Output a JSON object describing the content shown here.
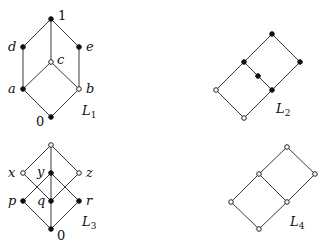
{
  "diagrams": [
    {
      "id": "L1",
      "label": "L",
      "subscript": "1",
      "nodes": [
        {
          "name": "1",
          "x": 51,
          "y": 19,
          "filled": true,
          "label": "1"
        },
        {
          "name": "d",
          "x": 23,
          "y": 47,
          "filled": true,
          "label": "d"
        },
        {
          "name": "e",
          "x": 79,
          "y": 47,
          "filled": true,
          "label": "e"
        },
        {
          "name": "c",
          "x": 51,
          "y": 62,
          "filled": false,
          "label": "c"
        },
        {
          "name": "a",
          "x": 23,
          "y": 89,
          "filled": true,
          "label": "a"
        },
        {
          "name": "b",
          "x": 79,
          "y": 89,
          "filled": false,
          "label": "b"
        },
        {
          "name": "0",
          "x": 51,
          "y": 117,
          "filled": true,
          "label": "0"
        }
      ],
      "edges": [
        [
          "1",
          "d"
        ],
        [
          "1",
          "e"
        ],
        [
          "1",
          "c"
        ],
        [
          "d",
          "a"
        ],
        [
          "e",
          "b"
        ],
        [
          "c",
          "a"
        ],
        [
          "c",
          "b"
        ],
        [
          "a",
          "0"
        ],
        [
          "b",
          "0"
        ]
      ]
    },
    {
      "id": "L2",
      "label": "L",
      "subscript": "2",
      "nodes": [
        {
          "name": "t",
          "x": 272,
          "y": 34,
          "filled": true
        },
        {
          "name": "r",
          "x": 300,
          "y": 62,
          "filled": true
        },
        {
          "name": "ul",
          "x": 244,
          "y": 62,
          "filled": true
        },
        {
          "name": "m",
          "x": 258,
          "y": 76,
          "filled": true
        },
        {
          "name": "mr",
          "x": 272,
          "y": 90,
          "filled": true
        },
        {
          "name": "l",
          "x": 216,
          "y": 90,
          "filled": false
        },
        {
          "name": "b",
          "x": 244,
          "y": 118,
          "filled": false
        }
      ],
      "edges": [
        [
          "t",
          "r"
        ],
        [
          "t",
          "ul"
        ],
        [
          "ul",
          "m"
        ],
        [
          "m",
          "mr"
        ],
        [
          "r",
          "mr"
        ],
        [
          "ul",
          "l"
        ],
        [
          "l",
          "b"
        ],
        [
          "mr",
          "b"
        ]
      ]
    },
    {
      "id": "L3",
      "label": "L",
      "subscript": "3",
      "nodes": [
        {
          "name": "top",
          "x": 51,
          "y": 145,
          "filled": false
        },
        {
          "name": "x",
          "x": 23,
          "y": 173,
          "filled": false,
          "label": "x"
        },
        {
          "name": "y",
          "x": 51,
          "y": 173,
          "filled": true,
          "label": "y"
        },
        {
          "name": "z",
          "x": 79,
          "y": 173,
          "filled": false,
          "label": "z"
        },
        {
          "name": "p",
          "x": 23,
          "y": 201,
          "filled": true,
          "label": "p"
        },
        {
          "name": "q",
          "x": 51,
          "y": 201,
          "filled": true,
          "label": "q"
        },
        {
          "name": "r",
          "x": 79,
          "y": 201,
          "filled": true,
          "label": "r"
        },
        {
          "name": "0",
          "x": 51,
          "y": 229,
          "filled": true,
          "label": "0"
        }
      ],
      "edges": [
        [
          "top",
          "x"
        ],
        [
          "top",
          "y"
        ],
        [
          "top",
          "z"
        ],
        [
          "x",
          "q"
        ],
        [
          "z",
          "q"
        ],
        [
          "y",
          "p"
        ],
        [
          "y",
          "r"
        ],
        [
          "y",
          "q"
        ],
        [
          "p",
          "0"
        ],
        [
          "q",
          "0"
        ],
        [
          "r",
          "0"
        ]
      ]
    },
    {
      "id": "L4",
      "label": "L",
      "subscript": "4",
      "nodes": [
        {
          "name": "t",
          "x": 287,
          "y": 147,
          "filled": false
        },
        {
          "name": "r",
          "x": 315,
          "y": 174,
          "filled": false
        },
        {
          "name": "ul",
          "x": 259,
          "y": 174,
          "filled": false
        },
        {
          "name": "mr",
          "x": 287,
          "y": 202,
          "filled": false
        },
        {
          "name": "l",
          "x": 231,
          "y": 202,
          "filled": false
        },
        {
          "name": "b",
          "x": 259,
          "y": 229,
          "filled": false
        }
      ],
      "edges": [
        [
          "t",
          "r"
        ],
        [
          "t",
          "ul"
        ],
        [
          "ul",
          "mr"
        ],
        [
          "r",
          "mr"
        ],
        [
          "ul",
          "l"
        ],
        [
          "l",
          "b"
        ],
        [
          "mr",
          "b"
        ]
      ]
    }
  ],
  "text": {
    "L1": {
      "main": "L",
      "sub": "1"
    },
    "L2": {
      "main": "L",
      "sub": "2"
    },
    "L3": {
      "main": "L",
      "sub": "3"
    },
    "L4": {
      "main": "L",
      "sub": "4"
    },
    "l1_nodes": {
      "one": "1",
      "d": "d",
      "e": "e",
      "c": "c",
      "a": "a",
      "b": "b",
      "zero": "0"
    },
    "l3_nodes": {
      "x": "x",
      "y": "y",
      "z": "z",
      "p": "p",
      "q": "q",
      "r": "r",
      "zero": "0"
    }
  }
}
